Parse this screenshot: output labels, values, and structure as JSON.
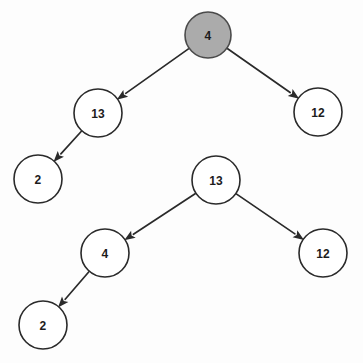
{
  "diagram": {
    "type": "directed-tree",
    "background_color": "#fdfdfd",
    "node_fill_default": "#ffffff",
    "node_fill_highlight": "#ababab",
    "node_stroke_color": "#2a2a2a",
    "edge_color": "#2a2a2a",
    "label_color": "#1c1c1c",
    "trees": [
      {
        "name": "upper-tree",
        "root_id": "n1"
      },
      {
        "name": "lower-tree",
        "root_id": "n5"
      }
    ],
    "nodes": [
      {
        "id": "n1",
        "label": "4",
        "cx": 208,
        "cy": 35,
        "r": 23,
        "highlighted": true,
        "tree": "upper-tree",
        "role": "root"
      },
      {
        "id": "n2",
        "label": "13",
        "cx": 98,
        "cy": 113,
        "r": 24,
        "highlighted": false,
        "tree": "upper-tree",
        "role": "left-child"
      },
      {
        "id": "n3",
        "label": "12",
        "cx": 318,
        "cy": 112,
        "r": 24,
        "highlighted": false,
        "tree": "upper-tree",
        "role": "right-child"
      },
      {
        "id": "n4",
        "label": "2",
        "cx": 38,
        "cy": 179,
        "r": 24,
        "highlighted": false,
        "tree": "upper-tree",
        "role": "left-grandchild"
      },
      {
        "id": "n5",
        "label": "13",
        "cx": 216,
        "cy": 180,
        "r": 24,
        "highlighted": false,
        "tree": "lower-tree",
        "role": "root"
      },
      {
        "id": "n6",
        "label": "4",
        "cx": 105,
        "cy": 253,
        "r": 24,
        "highlighted": false,
        "tree": "lower-tree",
        "role": "left-child"
      },
      {
        "id": "n7",
        "label": "12",
        "cx": 323,
        "cy": 253,
        "r": 24,
        "highlighted": false,
        "tree": "lower-tree",
        "role": "right-child"
      },
      {
        "id": "n8",
        "label": "2",
        "cx": 43,
        "cy": 325,
        "r": 24,
        "highlighted": false,
        "tree": "lower-tree",
        "role": "left-grandchild"
      }
    ],
    "edges": [
      {
        "id": "e1",
        "from": "n1",
        "to": "n2",
        "directed": true,
        "label": ""
      },
      {
        "id": "e2",
        "from": "n1",
        "to": "n3",
        "directed": true,
        "label": ""
      },
      {
        "id": "e3",
        "from": "n2",
        "to": "n4",
        "directed": true,
        "label": ""
      },
      {
        "id": "e4",
        "from": "n5",
        "to": "n6",
        "directed": true,
        "label": ""
      },
      {
        "id": "e5",
        "from": "n5",
        "to": "n7",
        "directed": true,
        "label": ""
      },
      {
        "id": "e6",
        "from": "n6",
        "to": "n8",
        "directed": true,
        "label": ""
      }
    ]
  }
}
